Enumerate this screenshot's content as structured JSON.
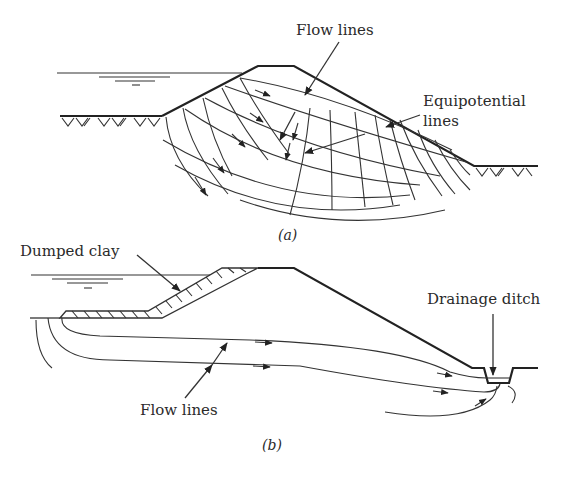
{
  "figure_a": {
    "caption": "(a)",
    "labels": {
      "flow_lines": "Flow lines",
      "equipotential_line1": "Equipotential",
      "equipotential_line2": "lines"
    }
  },
  "figure_b": {
    "caption": "(b)",
    "labels": {
      "dumped_clay": "Dumped clay",
      "drainage_ditch": "Drainage ditch",
      "flow_lines": "Flow lines"
    }
  },
  "colors": {
    "line": "#222222",
    "text": "#2a2a2a",
    "background": "#ffffff"
  }
}
